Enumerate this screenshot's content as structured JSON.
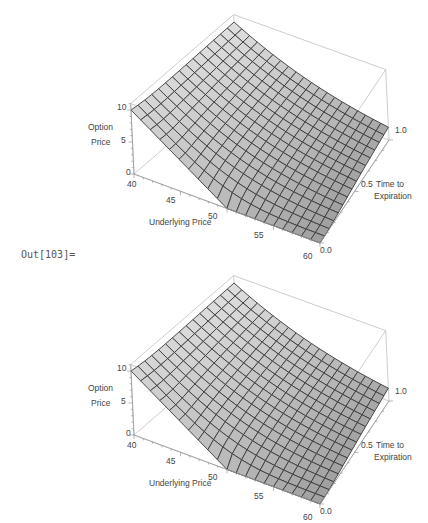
{
  "cell": {
    "out_label": "Out[103]="
  },
  "plots": [
    {
      "axes": {
        "x_label": "Underlying Price",
        "y_label_line1": "Time to",
        "y_label_line2": "Expiration",
        "z_label_line1": "Option",
        "z_label_line2": "Price",
        "x_ticks": [
          "40",
          "45",
          "50",
          "55",
          "60"
        ],
        "y_ticks": [
          "0.0",
          "0.5",
          "1.0"
        ],
        "z_ticks": [
          "0",
          "5",
          "10"
        ]
      }
    },
    {
      "axes": {
        "x_label": "Underlying Price",
        "y_label_line1": "Time to",
        "y_label_line2": "Expiration",
        "z_label_line1": "Option",
        "z_label_line2": "Price",
        "x_ticks": [
          "40",
          "45",
          "50",
          "55",
          "60"
        ],
        "y_ticks": [
          "0.0",
          "0.5",
          "1.0"
        ],
        "z_ticks": [
          "0",
          "5",
          "10"
        ]
      }
    }
  ],
  "chart_data": [
    {
      "type": "surface3d",
      "title": "",
      "xlabel": "Underlying Price",
      "ylabel": "Time to Expiration",
      "zlabel": "Option Price",
      "xlim": [
        40,
        60
      ],
      "ylim": [
        0.0,
        1.0
      ],
      "zlim": [
        0,
        11
      ],
      "x_ticks": [
        40,
        45,
        50,
        55,
        60
      ],
      "y_ticks": [
        0.0,
        0.5,
        1.0
      ],
      "z_ticks": [
        0,
        5,
        10
      ],
      "grid_mesh": [
        20,
        15
      ],
      "description": "European put option price surface, strike 50; payoff max(50-S,0) at T=0, rising with time to expiration",
      "strike": 50,
      "samples": {
        "S40_T0": 10,
        "S50_T0": 0,
        "S60_T0": 0,
        "S40_T1": 10.4,
        "S50_T1": 4.0,
        "S60_T1": 3.6
      }
    },
    {
      "type": "surface3d",
      "title": "",
      "xlabel": "Underlying Price",
      "ylabel": "Time to Expiration",
      "zlabel": "Option Price",
      "xlim": [
        40,
        60
      ],
      "ylim": [
        0.0,
        1.0
      ],
      "zlim": [
        0,
        11
      ],
      "x_ticks": [
        40,
        45,
        50,
        55,
        60
      ],
      "y_ticks": [
        0.0,
        0.5,
        1.0
      ],
      "z_ticks": [
        0,
        5,
        10
      ],
      "grid_mesh": [
        20,
        15
      ],
      "description": "European put option price surface, strike 50 (duplicate plot)",
      "strike": 50
    }
  ]
}
